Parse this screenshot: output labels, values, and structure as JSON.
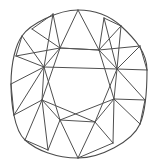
{
  "figure": {
    "title": "Cushion cut diamond facet diagram",
    "view": "face-up crown view",
    "shape_name": "cushion",
    "background_color": "#ffffff",
    "line_color": "#4f4f4f",
    "outline_color": "#4b4b4b",
    "line_width": 1,
    "canvas": {
      "width": 157,
      "height": 167
    }
  },
  "geometry": {
    "outline_vertices": [
      {
        "name": "top",
        "x": 78,
        "y": 10
      },
      {
        "name": "upper-right-corner",
        "x": 121,
        "y": 26
      },
      {
        "name": "right",
        "x": 147,
        "y": 70
      },
      {
        "name": "lower-right-corner",
        "x": 140,
        "y": 124
      },
      {
        "name": "bottom",
        "x": 78,
        "y": 158
      },
      {
        "name": "lower-left-corner",
        "x": 25,
        "y": 140
      },
      {
        "name": "left",
        "x": 11,
        "y": 84
      },
      {
        "name": "upper-left-corner",
        "x": 32,
        "y": 29
      }
    ],
    "table_vertices": [
      {
        "name": "table-top-left",
        "x": 60,
        "y": 48
      },
      {
        "name": "table-top-right",
        "x": 99,
        "y": 50
      },
      {
        "name": "table-right-upper",
        "x": 117,
        "y": 69
      },
      {
        "name": "table-right-lower",
        "x": 114,
        "y": 99
      },
      {
        "name": "table-bottom-right",
        "x": 95,
        "y": 122
      },
      {
        "name": "table-bottom-left",
        "x": 60,
        "y": 120
      },
      {
        "name": "table-left-lower",
        "x": 42,
        "y": 100
      },
      {
        "name": "table-left-upper",
        "x": 44,
        "y": 67
      }
    ],
    "girdle_vertices": [
      {
        "name": "girdle-top-left",
        "x": 53,
        "y": 14
      },
      {
        "name": "girdle-top-right",
        "x": 104,
        "y": 18
      },
      {
        "name": "girdle-right-upper",
        "x": 140,
        "y": 46
      },
      {
        "name": "girdle-right-lower",
        "x": 145,
        "y": 100
      },
      {
        "name": "girdle-bottom-right",
        "x": 113,
        "y": 143
      },
      {
        "name": "girdle-bottom-left",
        "x": 48,
        "y": 150
      },
      {
        "name": "girdle-left-lower",
        "x": 14,
        "y": 115
      },
      {
        "name": "girdle-left-upper",
        "x": 16,
        "y": 56
      }
    ],
    "facet_counts": {
      "outline_sides": 8,
      "table_sides": 8,
      "star_facets": 8,
      "bezel_facets": 8,
      "upper_girdle_facets": 16
    }
  },
  "paths": {
    "outline": "M 78 10 C 96 10 111 17 121 26 C 134 38 147 52 147 70 C 147 90 146 110 140 124 C 132 142 100 158 78 158 C 56 158 36 150 25 140 C 14 130 11 102 11 84 C 11 62 16 44 22 36 C 30 24 58 10 78 10 Z",
    "table": "M 60 48 L 99 50 L 117 69 L 114 99 L 95 122 L 60 120 L 42 100 L 44 67 Z",
    "facets": [
      "M 78 10 L 60 48",
      "M 78 10 L 99 50",
      "M 53 14 L 60 48",
      "M 53 14 L 44 67",
      "M 104 18 L 99 50",
      "M 104 18 L 117 69",
      "M 140 46 L 117 69",
      "M 140 46 L 99 50",
      "M 147 70 L 117 69",
      "M 145 100 L 117 69",
      "M 145 100 L 114 99",
      "M 140 124 L 114 99",
      "M 113 143 L 114 99",
      "M 113 143 L 95 122",
      "M 78 158 L 95 122",
      "M 78 158 L 60 120",
      "M 48 150 L 60 120",
      "M 48 150 L 42 100",
      "M 25 140 L 42 100",
      "M 14 115 L 42 100",
      "M 14 115 L 44 67",
      "M 11 84 L 44 67",
      "M 16 56 L 44 67",
      "M 16 56 L 60 48",
      "M 32 29 L 60 48",
      "M 22 36 L 44 67",
      "M 121 26 L 99 50",
      "M 121 26 L 117 69",
      "M 53 14 L 32 29",
      "M 104 18 L 121 26",
      "M 140 46 L 147 70",
      "M 145 100 L 140 124",
      "M 113 143 L 78 158",
      "M 48 150 L 25 140",
      "M 14 115 L 11 84",
      "M 16 56 L 22 36",
      "M 60 48 L 99 50",
      "M 99 50 L 114 99",
      "M 117 69 L 95 122",
      "M 114 99 L 60 120",
      "M 95 122 L 42 100",
      "M 60 120 L 44 67",
      "M 42 100 L 60 48",
      "M 44 67 L 117 69"
    ]
  }
}
